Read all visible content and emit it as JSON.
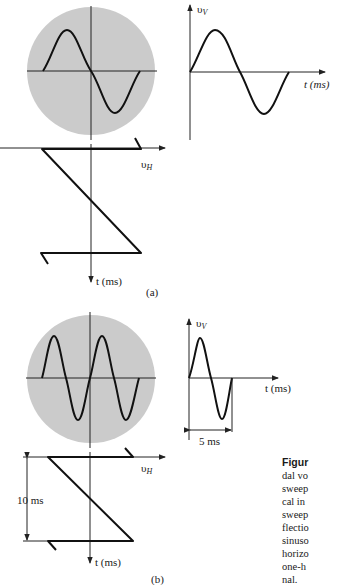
{
  "figure": {
    "panel_a": {
      "label": "(a)",
      "screen": {
        "description": "CRT screen showing one sine cycle",
        "cycles_displayed": 1
      },
      "vertical_signal": {
        "axis_label_v": "υ",
        "axis_label_sub": "V",
        "time_axis_label": "t (ms)",
        "cycles": 1
      },
      "sweep": {
        "axis_label_h": "υ",
        "axis_label_sub": "H",
        "time_axis_label": "t (ms)"
      }
    },
    "panel_b": {
      "label": "(b)",
      "screen": {
        "description": "CRT screen showing two sine cycles",
        "cycles_displayed": 2
      },
      "vertical_signal": {
        "axis_label_v": "υ",
        "axis_label_sub": "V",
        "time_axis_label": "t (ms)",
        "cycles": 1,
        "period_label": "5 ms"
      },
      "sweep": {
        "axis_label_h": "υ",
        "axis_label_sub": "H",
        "time_axis_label": "t (ms)",
        "period_label": "10 ms"
      }
    },
    "caption_lines": [
      "Figur",
      "dal vo",
      "sweep",
      "cal in",
      "sweep",
      "flectio",
      "sinuso",
      "horizo",
      "one-h",
      "nal."
    ]
  },
  "colors": {
    "screen": "#cbcbcb",
    "trace": "#111111",
    "axis": "#222222"
  }
}
